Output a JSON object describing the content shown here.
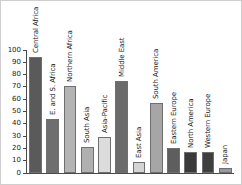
{
  "chart_data": {
    "type": "bar",
    "title": "",
    "subtitle": "",
    "xlabel": "",
    "ylabel": "",
    "ylim": [
      0,
      100
    ],
    "grid": false,
    "legend": "none",
    "orientation": "vertical",
    "label_rotation": "vertical",
    "categories": [
      "Central Africa",
      "E. and S. Africa",
      "Northern Africa",
      "South Asia",
      "Asia-Pacific",
      "Middle East",
      "East Asia",
      "South America",
      "Eastern Europe",
      "North America",
      "Western Europe",
      "Japan"
    ],
    "values": [
      94,
      44,
      71,
      21,
      29,
      75,
      9,
      57,
      20,
      17,
      17,
      4
    ],
    "colors": [
      "#5a5a5a",
      "#6e6e6e",
      "#b4b4b4",
      "#b0b0b0",
      "#dcdcdc",
      "#6b6b6b",
      "#d4d4d4",
      "#a6a6a6",
      "#5e5e5e",
      "#3a3a3a",
      "#3f3f3f",
      "#9a9a9a"
    ],
    "yticks": [
      0,
      10,
      20,
      30,
      40,
      50,
      60,
      70,
      80,
      90,
      100
    ],
    "ytick_labels": [
      "0",
      "10",
      "20",
      "30",
      "40",
      "50",
      "60",
      "70",
      "80",
      "90",
      "100"
    ]
  },
  "axis": {
    "axis_color": "#4a4a4a",
    "bar_edge_color": "#6f6f6f"
  }
}
